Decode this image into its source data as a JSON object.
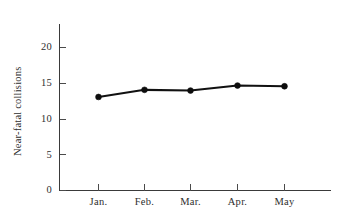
{
  "chart_data": {
    "type": "line",
    "title": "",
    "subtitle": "",
    "xlabel": "",
    "ylabel": "Near-fatal collisions",
    "categories": [
      "Jan.",
      "Feb.",
      "Mar.",
      "Apr.",
      "May"
    ],
    "values": [
      13.1,
      14.1,
      14.0,
      14.7,
      14.6
    ],
    "series": [
      {
        "name": "Near-fatal collisions",
        "values": [
          13.1,
          14.1,
          14.0,
          14.7,
          14.6
        ]
      }
    ],
    "ylim": [
      0,
      22
    ],
    "yticks": [
      0,
      5,
      10,
      15,
      20
    ],
    "ytick_labels": [
      "0",
      "5",
      "10",
      "15",
      "20"
    ],
    "xtick_labels": [
      "Jan.",
      "Feb.",
      "Mar.",
      "Apr.",
      "May"
    ],
    "grid": false,
    "legend": false,
    "legend_position": "none",
    "marker": "filled-circle",
    "line_color": "#111111",
    "marker_color": "#0d0d0d",
    "axis_color": "#3a3a3a",
    "background_color": "#ffffff"
  }
}
